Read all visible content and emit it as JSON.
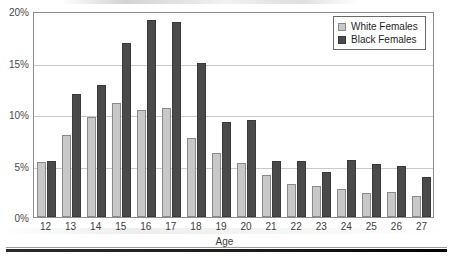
{
  "chart_data": {
    "type": "bar",
    "title": "",
    "xlabel": "Age",
    "ylabel": "",
    "categories": [
      "12",
      "13",
      "14",
      "15",
      "16",
      "17",
      "18",
      "19",
      "20",
      "21",
      "22",
      "23",
      "24",
      "25",
      "26",
      "27"
    ],
    "series": [
      {
        "name": "White Females",
        "color": "#c8c8c8",
        "values": [
          5.3,
          8.0,
          9.7,
          11.1,
          10.4,
          10.6,
          7.7,
          6.2,
          5.2,
          4.1,
          3.2,
          3.0,
          2.7,
          2.3,
          2.4,
          2.0
        ]
      },
      {
        "name": "Black Females",
        "color": "#4a4a4a",
        "values": [
          5.4,
          11.9,
          12.8,
          16.9,
          19.1,
          18.9,
          15.0,
          9.2,
          9.4,
          5.4,
          5.4,
          4.4,
          5.5,
          5.1,
          5.0,
          3.9
        ]
      }
    ],
    "ylim": [
      0,
      20
    ],
    "yticks": [
      0,
      5,
      10,
      15,
      20
    ],
    "ytick_labels": [
      "0%",
      "5%",
      "10%",
      "15%",
      "20%"
    ],
    "grid": true,
    "legend_position": "top-right"
  },
  "legend": {
    "items": [
      {
        "label": "White Females",
        "swatch": "white-females-swatch"
      },
      {
        "label": "Black Females",
        "swatch": "black-females-swatch"
      }
    ]
  }
}
